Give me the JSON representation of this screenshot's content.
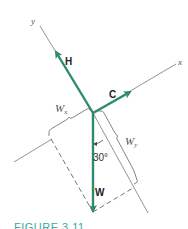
{
  "diagram": {
    "type": "force-resolution",
    "axes": {
      "x_label": "x",
      "y_label": "y"
    },
    "vectors": [
      {
        "name": "H",
        "label": "H",
        "direction": "along +y axis"
      },
      {
        "name": "C",
        "label": "C",
        "direction": "along +x axis"
      },
      {
        "name": "W",
        "label": "W",
        "direction": "vertically downward"
      }
    ],
    "components": {
      "wx_label": "W",
      "wx_sub": "x",
      "wy_label": "W",
      "wy_sub": "y"
    },
    "angle": {
      "label": "30°",
      "value_deg": 30
    },
    "colors": {
      "vector": "#2e8b6e",
      "axis": "#777777",
      "caption": "#3aa6a0"
    }
  },
  "caption": "FIGURE 3.11"
}
